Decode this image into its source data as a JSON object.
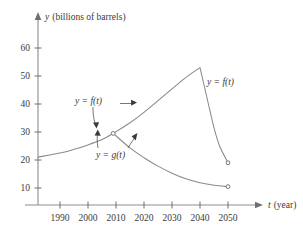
{
  "chart_data": {
    "type": "line",
    "title": "",
    "xlabel": "t (year)",
    "ylabel": "y (billions of barrels)",
    "xlim": [
      1982,
      2060
    ],
    "ylim": [
      0,
      68
    ],
    "grid": false,
    "legend": "inline-annotations",
    "x_ticks": [
      "1990",
      "2000",
      "2010",
      "2020",
      "2030",
      "2040",
      "2050"
    ],
    "x_tick_values": [
      1990,
      2000,
      2010,
      2020,
      2030,
      2040,
      2050
    ],
    "y_ticks": [
      "60",
      "50",
      "40",
      "30",
      "20",
      "10"
    ],
    "y_tick_values": [
      60,
      50,
      40,
      30,
      20,
      10
    ],
    "series": [
      {
        "name": "y = f(t)",
        "label": "y = f(t)",
        "description": "rises from 21 at 1982 through 29.5 at 2009, peaks at 53 in 2040, then falls steeply to 19 at 2050",
        "points": [
          {
            "x": 1982,
            "y": 21.0
          },
          {
            "x": 1990,
            "y": 22.5
          },
          {
            "x": 1995,
            "y": 23.8
          },
          {
            "x": 2000,
            "y": 25.4
          },
          {
            "x": 2005,
            "y": 27.3
          },
          {
            "x": 2009,
            "y": 29.5
          },
          {
            "x": 2015,
            "y": 33.3
          },
          {
            "x": 2020,
            "y": 37.0
          },
          {
            "x": 2025,
            "y": 41.2
          },
          {
            "x": 2030,
            "y": 45.4
          },
          {
            "x": 2035,
            "y": 49.5
          },
          {
            "x": 2040,
            "y": 53.0
          },
          {
            "x": 2043,
            "y": 40.0
          },
          {
            "x": 2045,
            "y": 31.5
          },
          {
            "x": 2047,
            "y": 25.0
          },
          {
            "x": 2050,
            "y": 19.0
          }
        ],
        "peak": {
          "x": 2040,
          "y": 53.0
        },
        "endpoint": {
          "x": 2050,
          "y": 19.0,
          "marker": "open-circle"
        }
      },
      {
        "name": "y = g(t)",
        "label": "y = g(t)",
        "description": "shares the branch point at 2009 (29.5) then decays to 10.5 at 2050",
        "points": [
          {
            "x": 2009,
            "y": 29.5
          },
          {
            "x": 2015,
            "y": 24.3
          },
          {
            "x": 2020,
            "y": 20.8
          },
          {
            "x": 2025,
            "y": 17.8
          },
          {
            "x": 2030,
            "y": 15.3
          },
          {
            "x": 2035,
            "y": 13.3
          },
          {
            "x": 2040,
            "y": 11.9
          },
          {
            "x": 2045,
            "y": 11.0
          },
          {
            "x": 2050,
            "y": 10.5
          }
        ],
        "endpoint": {
          "x": 2050,
          "y": 10.5,
          "marker": "open-circle"
        }
      }
    ],
    "annotations": [
      {
        "id": "f-left-label",
        "text": "y = f(t)",
        "anchor_x": 2000,
        "anchor_y": 39.0,
        "points_to": [
          {
            "x": 2002,
            "y": 26.0
          },
          {
            "x": 2015,
            "y": 33.5
          }
        ]
      },
      {
        "id": "g-label",
        "text": "y = g(t)",
        "anchor_x": 2001,
        "anchor_y": 14.5,
        "points_to": [
          {
            "x": 2003,
            "y": 25.0
          },
          {
            "x": 2014,
            "y": 24.8
          }
        ]
      },
      {
        "id": "f-right-label",
        "text": "y = f(t)",
        "anchor_x": 2043,
        "anchor_y": 44.0
      }
    ],
    "colors": {
      "curve": "#8a8a8a",
      "axis": "#8e8e8e",
      "text": "#3a3a3a",
      "background": "#ffffff"
    }
  },
  "axes": {
    "y_axis_title": "y (billions of barrels)",
    "x_axis_title": "t (year)",
    "y_axis_symbol": "y",
    "y_axis_unit": "(billions of barrels)",
    "x_axis_symbol": "t",
    "x_axis_unit": "(year)"
  },
  "labels": {
    "f_left": "y = f(t)",
    "f_right": "y = f(t)",
    "g": "y = g(t)"
  },
  "ticks": {
    "x": [
      "1990",
      "2000",
      "2010",
      "2020",
      "2030",
      "2040",
      "2050"
    ],
    "y": [
      "60",
      "50",
      "40",
      "30",
      "20",
      "10"
    ]
  }
}
